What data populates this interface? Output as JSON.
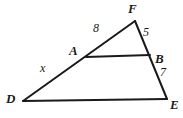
{
  "figure": {
    "type": "geometry-diagram",
    "stroke_color": "#1a1a1a",
    "background_color": "#ffffff",
    "vertices": [
      {
        "name": "D",
        "label": "D",
        "x": 23,
        "y": 101
      },
      {
        "name": "E",
        "label": "E",
        "x": 167,
        "y": 99
      },
      {
        "name": "F",
        "label": "F",
        "x": 135,
        "y": 21
      },
      {
        "name": "A",
        "label": "A",
        "x": 86,
        "y": 57
      },
      {
        "name": "B",
        "label": "B",
        "x": 150,
        "y": 55
      }
    ],
    "segments": [
      {
        "name": "segment-DF",
        "from": "D",
        "to": "F"
      },
      {
        "name": "segment-FE",
        "from": "F",
        "to": "E"
      },
      {
        "name": "segment-DE",
        "from": "D",
        "to": "E"
      },
      {
        "name": "segment-AB",
        "from": "A",
        "to": "B"
      }
    ],
    "vertex_labels": [
      {
        "name": "label-F",
        "text": "F",
        "x": 128,
        "y": 2
      },
      {
        "name": "label-A",
        "text": "A",
        "x": 69,
        "y": 44
      },
      {
        "name": "label-B",
        "text": "B",
        "x": 155,
        "y": 52
      },
      {
        "name": "label-D",
        "text": "D",
        "x": 6,
        "y": 92
      },
      {
        "name": "label-E",
        "text": "E",
        "x": 170,
        "y": 98
      }
    ],
    "measure_labels": [
      {
        "name": "measure-FA",
        "text": "8",
        "value": 8,
        "segment": "FA",
        "x": 93,
        "y": 22
      },
      {
        "name": "measure-FB",
        "text": "5",
        "value": 5,
        "segment": "FB",
        "x": 143,
        "y": 26
      },
      {
        "name": "measure-BE",
        "text": "7",
        "value": 7,
        "segment": "BE",
        "x": 160,
        "y": 66
      },
      {
        "name": "measure-AD",
        "text": "x",
        "value": "x",
        "segment": "AD",
        "x": 40,
        "y": 62
      }
    ]
  }
}
